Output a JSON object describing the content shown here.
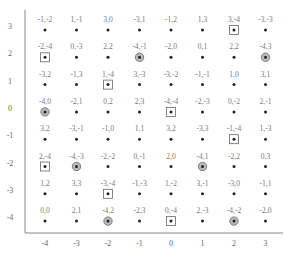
{
  "chart_data": {
    "type": "scatter",
    "title": "",
    "xlabel": "",
    "ylabel": "",
    "xlim": [
      -4,
      3
    ],
    "ylim": [
      -4,
      3
    ],
    "grid": false,
    "legend": "none",
    "x_ticks": [
      "-4",
      "-3",
      "-2",
      "-1",
      "0",
      "1",
      "2",
      "3"
    ],
    "y_ticks": [
      "3",
      "2",
      "1",
      "0",
      "-1",
      "-2",
      "-3",
      "-4"
    ],
    "marker_types": {
      "dot": "plain dot",
      "box": "dot inside square",
      "ring": "dot inside circle"
    },
    "points": [
      {
        "x": -4,
        "y": 3,
        "label": "-1,-2",
        "marker": "dot"
      },
      {
        "x": -3,
        "y": 3,
        "label": "1,-1",
        "marker": "dot"
      },
      {
        "x": -2,
        "y": 3,
        "label": "3,0",
        "marker": "dot"
      },
      {
        "x": -1,
        "y": 3,
        "label": "-3,1",
        "marker": "dot"
      },
      {
        "x": 0,
        "y": 3,
        "label": "-1,2",
        "marker": "dot"
      },
      {
        "x": 1,
        "y": 3,
        "label": "1,3",
        "marker": "dot"
      },
      {
        "x": 2,
        "y": 3,
        "label": "3,-4",
        "marker": "box"
      },
      {
        "x": 3,
        "y": 3,
        "label": "-3,-3",
        "marker": "dot"
      },
      {
        "x": -4,
        "y": 2,
        "label": "-2,-4",
        "marker": "box"
      },
      {
        "x": -3,
        "y": 2,
        "label": "0,-3",
        "marker": "dot"
      },
      {
        "x": -2,
        "y": 2,
        "label": "2,2",
        "marker": "dot"
      },
      {
        "x": -1,
        "y": 2,
        "label": "-4,-1",
        "marker": "ring"
      },
      {
        "x": 0,
        "y": 2,
        "label": "-2,0",
        "marker": "dot"
      },
      {
        "x": 1,
        "y": 2,
        "label": "0,1",
        "marker": "dot"
      },
      {
        "x": 2,
        "y": 2,
        "label": "2,2",
        "marker": "dot"
      },
      {
        "x": 3,
        "y": 2,
        "label": "-4,3",
        "marker": "ring"
      },
      {
        "x": -4,
        "y": 1,
        "label": "-3,2",
        "marker": "dot"
      },
      {
        "x": -3,
        "y": 1,
        "label": "-1,3",
        "marker": "dot"
      },
      {
        "x": -2,
        "y": 1,
        "label": "1,-4",
        "marker": "box"
      },
      {
        "x": -1,
        "y": 1,
        "label": "3,-3",
        "marker": "dot"
      },
      {
        "x": 0,
        "y": 1,
        "label": "-3,-2",
        "marker": "dot"
      },
      {
        "x": 1,
        "y": 1,
        "label": "-1,-1",
        "marker": "dot"
      },
      {
        "x": 2,
        "y": 1,
        "label": "1,0",
        "marker": "dot"
      },
      {
        "x": 3,
        "y": 1,
        "label": "3,1",
        "marker": "dot"
      },
      {
        "x": -4,
        "y": 0,
        "label": "-4,0",
        "marker": "ring"
      },
      {
        "x": -3,
        "y": 0,
        "label": "-2,1",
        "marker": "dot"
      },
      {
        "x": -2,
        "y": 0,
        "label": "0,2",
        "marker": "dot"
      },
      {
        "x": -1,
        "y": 0,
        "label": "2,3",
        "marker": "dot"
      },
      {
        "x": 0,
        "y": 0,
        "label": "-4,-4",
        "marker": "box"
      },
      {
        "x": 1,
        "y": 0,
        "label": "-2,-3",
        "marker": "dot"
      },
      {
        "x": 2,
        "y": 0,
        "label": "0,-2",
        "marker": "dot"
      },
      {
        "x": 3,
        "y": 0,
        "label": "2,-1",
        "marker": "dot"
      },
      {
        "x": -4,
        "y": -1,
        "label": "3,2",
        "marker": "dot"
      },
      {
        "x": -3,
        "y": -1,
        "label": "-3,-1",
        "marker": "dot"
      },
      {
        "x": -2,
        "y": -1,
        "label": "-1,0",
        "marker": "dot"
      },
      {
        "x": -1,
        "y": -1,
        "label": "1,1",
        "marker": "dot"
      },
      {
        "x": 0,
        "y": -1,
        "label": "3,2",
        "marker": "dot"
      },
      {
        "x": 1,
        "y": -1,
        "label": "-3,3",
        "marker": "dot"
      },
      {
        "x": 2,
        "y": -1,
        "label": "-1,-4",
        "marker": "box"
      },
      {
        "x": 3,
        "y": -1,
        "label": "1,-3",
        "marker": "dot"
      },
      {
        "x": -4,
        "y": -2,
        "label": "2,-4",
        "marker": "box"
      },
      {
        "x": -3,
        "y": -2,
        "label": "-4,-3",
        "marker": "ring"
      },
      {
        "x": -2,
        "y": -2,
        "label": "-2,-2",
        "marker": "dot"
      },
      {
        "x": -1,
        "y": -2,
        "label": "0,-1",
        "marker": "dot"
      },
      {
        "x": 0,
        "y": -2,
        "label": "2,0",
        "marker": "dot"
      },
      {
        "x": 1,
        "y": -2,
        "label": "-4,1",
        "marker": "ring"
      },
      {
        "x": 2,
        "y": -2,
        "label": "-2,2",
        "marker": "dot"
      },
      {
        "x": 3,
        "y": -2,
        "label": "0,3",
        "marker": "dot"
      },
      {
        "x": -4,
        "y": -3,
        "label": "1,2",
        "marker": "dot"
      },
      {
        "x": -3,
        "y": -3,
        "label": "3,3",
        "marker": "dot"
      },
      {
        "x": -2,
        "y": -3,
        "label": "-3,-4",
        "marker": "box"
      },
      {
        "x": -1,
        "y": -3,
        "label": "-1,-3",
        "marker": "dot"
      },
      {
        "x": 0,
        "y": -3,
        "label": "1,-2",
        "marker": "dot"
      },
      {
        "x": 1,
        "y": -3,
        "label": "3,-1",
        "marker": "dot"
      },
      {
        "x": 2,
        "y": -3,
        "label": "-3,0",
        "marker": "dot"
      },
      {
        "x": 3,
        "y": -3,
        "label": "-1,1",
        "marker": "dot"
      },
      {
        "x": -4,
        "y": -4,
        "label": "0,0",
        "marker": "dot"
      },
      {
        "x": -3,
        "y": -4,
        "label": "2,1",
        "marker": "dot"
      },
      {
        "x": -2,
        "y": -4,
        "label": "-4,2",
        "marker": "ring"
      },
      {
        "x": -1,
        "y": -4,
        "label": "-2,3",
        "marker": "dot"
      },
      {
        "x": 0,
        "y": -4,
        "label": "0,-4",
        "marker": "box"
      },
      {
        "x": 1,
        "y": -4,
        "label": "2,-3",
        "marker": "dot"
      },
      {
        "x": 2,
        "y": -4,
        "label": "-4,-2",
        "marker": "ring"
      },
      {
        "x": 3,
        "y": -4,
        "label": "-2,0",
        "marker": "dot"
      }
    ]
  }
}
